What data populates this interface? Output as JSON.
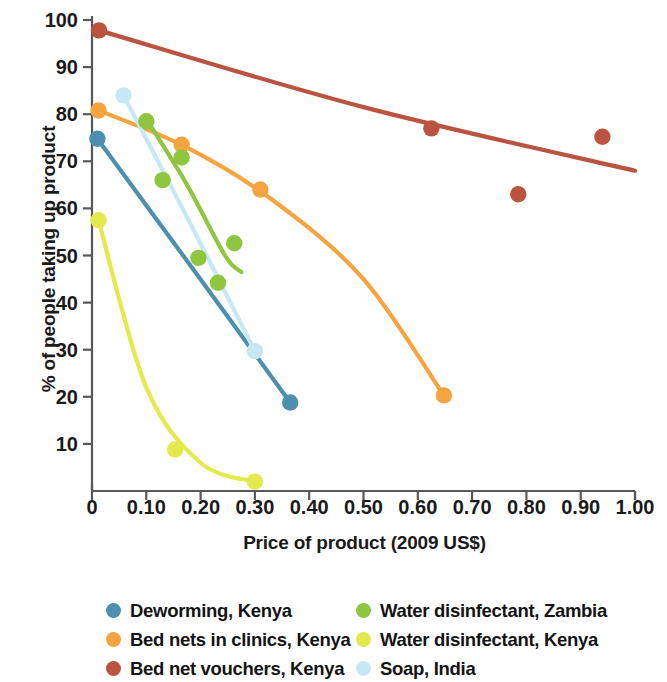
{
  "chart_data": {
    "type": "scatter",
    "title": "",
    "xlabel": "Price of product (2009 US$)",
    "ylabel": "% of people taking up product",
    "xlim": [
      0,
      1.0
    ],
    "ylim": [
      0,
      100
    ],
    "grid": false,
    "legend_position": "bottom",
    "xticks": [
      "0",
      "0.10",
      "0.20",
      "0.30",
      "0.40",
      "0.50",
      "0.60",
      "0.70",
      "0.80",
      "0.90",
      "1.00"
    ],
    "xtick_values": [
      0,
      0.1,
      0.2,
      0.3,
      0.4,
      0.5,
      0.6,
      0.7,
      0.8,
      0.9,
      1.0
    ],
    "yticks": [
      "10",
      "20",
      "30",
      "40",
      "50",
      "60",
      "70",
      "80",
      "90",
      "100"
    ],
    "ytick_values": [
      10,
      20,
      30,
      40,
      50,
      60,
      70,
      80,
      90,
      100
    ],
    "series": [
      {
        "name": "Deworming, Kenya",
        "color": "#4d90ad",
        "points": [
          {
            "x": 0.01,
            "y": 74.8
          },
          {
            "x": 0.365,
            "y": 18.8
          }
        ],
        "curve": [
          {
            "x": 0.01,
            "y": 74.8
          },
          {
            "x": 0.19,
            "y": 46.5
          },
          {
            "x": 0.365,
            "y": 18.8
          }
        ]
      },
      {
        "name": "Bed nets in clinics, Kenya",
        "color": "#f5a43f",
        "points": [
          {
            "x": 0.012,
            "y": 80.8
          },
          {
            "x": 0.165,
            "y": 73.5
          },
          {
            "x": 0.31,
            "y": 64.0
          },
          {
            "x": 0.648,
            "y": 20.3
          }
        ],
        "curve": [
          {
            "x": 0.012,
            "y": 80.8
          },
          {
            "x": 0.17,
            "y": 73.2
          },
          {
            "x": 0.33,
            "y": 62.0
          },
          {
            "x": 0.5,
            "y": 45.0
          },
          {
            "x": 0.648,
            "y": 20.3
          }
        ]
      },
      {
        "name": "Bed net vouchers, Kenya",
        "color": "#ba5340",
        "points": [
          {
            "x": 0.013,
            "y": 97.8
          },
          {
            "x": 0.625,
            "y": 77.0
          },
          {
            "x": 0.785,
            "y": 63.0
          },
          {
            "x": 0.94,
            "y": 75.2
          }
        ],
        "curve": [
          {
            "x": 0.013,
            "y": 97.8
          },
          {
            "x": 0.5,
            "y": 81.5
          },
          {
            "x": 1.0,
            "y": 68.0
          }
        ]
      },
      {
        "name": "Water disinfectant, Zambia",
        "color": "#8ec63f",
        "points": [
          {
            "x": 0.1,
            "y": 78.5
          },
          {
            "x": 0.13,
            "y": 66.0
          },
          {
            "x": 0.165,
            "y": 70.8
          },
          {
            "x": 0.196,
            "y": 49.5
          },
          {
            "x": 0.232,
            "y": 44.2
          },
          {
            "x": 0.262,
            "y": 52.6
          }
        ],
        "curve": [
          {
            "x": 0.1,
            "y": 79.0
          },
          {
            "x": 0.175,
            "y": 65.0
          },
          {
            "x": 0.245,
            "y": 50.0
          },
          {
            "x": 0.275,
            "y": 46.5
          }
        ]
      },
      {
        "name": "Water disinfectant, Kenya",
        "color": "#e2ea4c",
        "points": [
          {
            "x": 0.012,
            "y": 57.5
          },
          {
            "x": 0.153,
            "y": 8.8
          },
          {
            "x": 0.3,
            "y": 2.0
          }
        ],
        "curve": [
          {
            "x": 0.012,
            "y": 57.5
          },
          {
            "x": 0.1,
            "y": 22.0
          },
          {
            "x": 0.2,
            "y": 6.0
          },
          {
            "x": 0.3,
            "y": 2.0
          }
        ]
      },
      {
        "name": "Soap, India",
        "color": "#c6e8f4",
        "points": [
          {
            "x": 0.058,
            "y": 84.0
          },
          {
            "x": 0.3,
            "y": 29.7
          }
        ],
        "curve": [
          {
            "x": 0.058,
            "y": 84.0
          },
          {
            "x": 0.18,
            "y": 57.0
          },
          {
            "x": 0.3,
            "y": 29.7
          }
        ]
      }
    ]
  },
  "legend": {
    "column1": [
      {
        "label": "Deworming, Kenya",
        "color": "#4d90ad"
      },
      {
        "label": "Bed nets in clinics, Kenya",
        "color": "#f5a43f"
      },
      {
        "label": "Bed net vouchers, Kenya",
        "color": "#ba5340"
      }
    ],
    "column2": [
      {
        "label": "Water disinfectant, Zambia",
        "color": "#8ec63f"
      },
      {
        "label": "Water disinfectant, Kenya",
        "color": "#e2ea4c"
      },
      {
        "label": "Soap, India",
        "color": "#c6e8f4"
      }
    ]
  },
  "axis_colors": {
    "line": "#58585a",
    "text": "#1a1a1a"
  }
}
